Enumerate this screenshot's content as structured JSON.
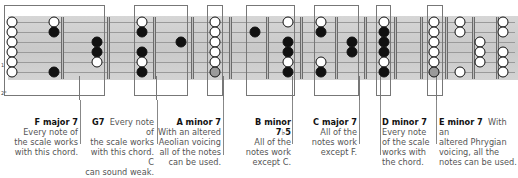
{
  "diagram": {
    "type": "guitar-fretboard-chord-scale-map",
    "colors": {
      "chord_tone": "#111111",
      "scale_tone": "#ffffff",
      "root_highlight": "#9a9a9a",
      "fretboard": "#cfcfcf",
      "box_border": "#777777"
    },
    "strings_y": [
      22,
      32,
      42,
      52,
      62,
      72
    ],
    "frets_x": [
      62,
      108,
      154,
      192,
      230,
      267,
      301,
      336,
      365,
      395,
      421,
      446,
      473,
      497
    ],
    "dot_columns": [
      {
        "x": 12,
        "dots": [
          "white",
          "white",
          "white",
          "white",
          "white",
          "white"
        ]
      },
      {
        "x": 54,
        "dots": [
          "white",
          "black",
          null,
          null,
          null,
          "black"
        ]
      },
      {
        "x": 97,
        "dots": [
          null,
          null,
          "black",
          "black",
          "white",
          null
        ]
      },
      {
        "x": 142,
        "dots": [
          "white",
          "black",
          null,
          "black",
          "white",
          "black"
        ]
      },
      {
        "x": 181,
        "dots": [
          null,
          null,
          "black",
          null,
          null,
          null
        ]
      },
      {
        "x": 215,
        "dots": [
          "white",
          "white",
          "white",
          "white",
          "white",
          "grey"
        ]
      },
      {
        "x": 255,
        "dots": [
          null,
          "black",
          null,
          null,
          null,
          null
        ]
      },
      {
        "x": 288,
        "dots": [
          "white",
          null,
          "black",
          "black",
          "white",
          "black"
        ]
      },
      {
        "x": 321,
        "dots": [
          "white",
          "black",
          null,
          null,
          "white",
          "black"
        ]
      },
      {
        "x": 352,
        "dots": [
          null,
          null,
          "black",
          "black",
          null,
          null
        ]
      },
      {
        "x": 384,
        "dots": [
          "white",
          "black",
          "black",
          "black",
          "white",
          "black"
        ]
      },
      {
        "x": 434,
        "dots": [
          "white",
          "white",
          "white",
          "white",
          "white",
          "grey"
        ]
      },
      {
        "x": 460,
        "dots": [
          "white",
          "white",
          null,
          null,
          null,
          "white"
        ]
      },
      {
        "x": 480,
        "dots": [
          null,
          null,
          "white",
          "white",
          "white",
          null
        ]
      },
      {
        "x": 503,
        "dots": [
          "white",
          "white",
          null,
          "white",
          "white",
          "white"
        ]
      }
    ],
    "boxes": [
      {
        "id": "f-major-7",
        "x": 4,
        "w": 101,
        "conn_x": 79
      },
      {
        "id": "g7",
        "x": 134,
        "w": 54,
        "conn_x": 156
      },
      {
        "id": "a-minor-7",
        "x": 207,
        "w": 16,
        "conn_x": 223
      },
      {
        "id": "b-minor-7b5",
        "x": 246,
        "w": 49,
        "conn_x": 292
      },
      {
        "id": "c-major-7",
        "x": 314,
        "w": 45,
        "conn_x": 359
      },
      {
        "id": "d-minor-7",
        "x": 376,
        "w": 15,
        "conn_x": 380
      },
      {
        "id": "e-minor-7",
        "x": 427,
        "w": 16,
        "conn_x": 436
      }
    ],
    "side_marks": {
      "string_mark": "1",
      "corner_mark": "2°"
    }
  },
  "labels": [
    {
      "title": "F major 7",
      "lines": [
        "Every note of",
        "the scale works",
        "with this chord."
      ]
    },
    {
      "title": "G7",
      "lead": "Every note of",
      "lines": [
        "the scale works",
        "with this chord. C",
        "can sound weak."
      ]
    },
    {
      "title": "A minor 7",
      "lines": [
        "With an altered",
        "Aeolian voicing",
        "all of the notes",
        "can be used."
      ]
    },
    {
      "title": "B minor 7♭5",
      "lines": [
        "All of the",
        "notes work",
        "except C."
      ]
    },
    {
      "title": "C major 7",
      "lines": [
        "All of the",
        "notes work",
        "except F."
      ]
    },
    {
      "title": "D minor 7",
      "lines": [
        "Every note",
        "of the scale",
        "works with",
        "the chord."
      ]
    },
    {
      "title": "E minor 7",
      "lead": "With an",
      "lines": [
        "altered Phrygian",
        "voicing, all the",
        "notes can be used."
      ]
    }
  ]
}
